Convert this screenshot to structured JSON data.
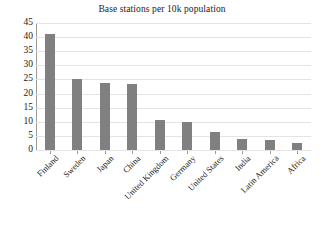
{
  "chart_data": {
    "type": "bar",
    "title": "Base stations per 10k population",
    "xlabel": "",
    "ylabel": "",
    "ylim": [
      0,
      45
    ],
    "yticks": [
      0,
      5,
      10,
      15,
      20,
      25,
      30,
      35,
      40,
      45
    ],
    "grid": true,
    "legend": false,
    "bar_color": "#808080",
    "categories": [
      "Finland",
      "Sweden",
      "Japan",
      "China",
      "United Kingdom",
      "Germany",
      "United States",
      "India",
      "Latin America",
      "Africa"
    ],
    "values": [
      41,
      25,
      23.8,
      23.3,
      10.7,
      9.8,
      6.3,
      4,
      3.7,
      2.4
    ]
  }
}
